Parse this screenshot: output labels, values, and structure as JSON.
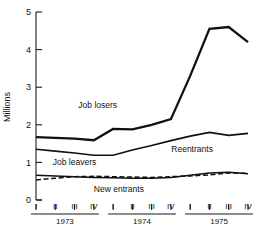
{
  "chart_data": {
    "type": "line",
    "title": "",
    "subtitle": "",
    "xlabel": "",
    "ylabel": "Millions",
    "ylim": [
      0,
      5
    ],
    "yticks": [
      0,
      1,
      2,
      3,
      4,
      5
    ],
    "ytick_labels": [
      "0",
      "1",
      "2",
      "3",
      "4",
      "5"
    ],
    "grid": false,
    "legend_position": "inline-annotations",
    "x": [
      "1973 I",
      "1973 II",
      "1973 III",
      "1973 IV",
      "1974 I",
      "1974 II",
      "1974 III",
      "1974 IV",
      "1975 I",
      "1975 II",
      "1975 III",
      "1975 IV"
    ],
    "quarter_labels": [
      "I",
      "II",
      "III",
      "IV",
      "I",
      "II",
      "III",
      "IV",
      "I",
      "II",
      "III",
      "IV"
    ],
    "year_groups": [
      {
        "label": "1973",
        "quarters": [
          "I",
          "II",
          "III",
          "IV"
        ]
      },
      {
        "label": "1974",
        "quarters": [
          "I",
          "II",
          "III",
          "IV"
        ]
      },
      {
        "label": "1975",
        "quarters": [
          "I",
          "II",
          "III",
          "IV"
        ]
      }
    ],
    "series": [
      {
        "name": "Job losers",
        "style": "solid-thick",
        "values": [
          1.67,
          1.65,
          1.63,
          1.59,
          1.89,
          1.88,
          2.0,
          2.15,
          3.3,
          4.55,
          4.6,
          4.2
        ]
      },
      {
        "name": "Reentrants",
        "style": "solid",
        "values": [
          1.35,
          1.3,
          1.25,
          1.19,
          1.19,
          1.33,
          1.45,
          1.58,
          1.7,
          1.8,
          1.72,
          1.77
        ]
      },
      {
        "name": "Job leavers",
        "style": "solid",
        "values": [
          0.66,
          0.64,
          0.62,
          0.6,
          0.59,
          0.58,
          0.58,
          0.6,
          0.66,
          0.72,
          0.74,
          0.7
        ]
      },
      {
        "name": "New entrants",
        "style": "dashed",
        "values": [
          0.53,
          0.58,
          0.62,
          0.63,
          0.62,
          0.61,
          0.6,
          0.62,
          0.64,
          0.67,
          0.72,
          0.71
        ]
      }
    ],
    "annotations": [
      {
        "text": "Job losers",
        "x_index": 3.2,
        "y_value": 2.45
      },
      {
        "text": "Reentrants",
        "x_index": 8.1,
        "y_value": 1.28
      },
      {
        "text": "Job leavers",
        "x_index": 2.0,
        "y_value": 0.92
      },
      {
        "text": "New entrants",
        "x_index": 4.3,
        "y_value": 0.22
      }
    ]
  }
}
